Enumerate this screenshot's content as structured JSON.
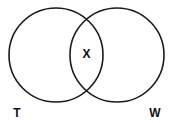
{
  "diagram": {
    "type": "venn",
    "sets": [
      {
        "label": "T",
        "cx": 56,
        "cy": 55,
        "r": 47
      },
      {
        "label": "W",
        "cx": 117,
        "cy": 55,
        "r": 47
      }
    ],
    "intersection_label": "X",
    "stroke_color": "#1a1a1a",
    "background": "#ffffff"
  }
}
